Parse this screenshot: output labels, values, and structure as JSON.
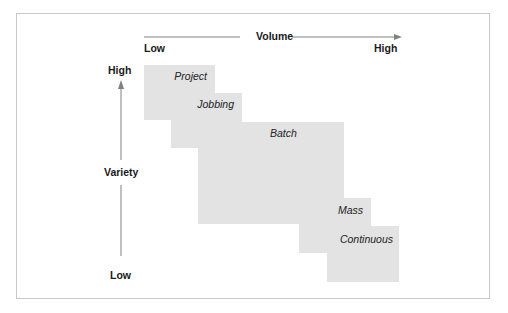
{
  "diagram": {
    "axes": {
      "x": {
        "title": "Volume",
        "low": "Low",
        "high": "High"
      },
      "y": {
        "title": "Variety",
        "low": "Low",
        "high": "High"
      }
    },
    "processes": [
      {
        "label": "Project"
      },
      {
        "label": "Jobbing"
      },
      {
        "label": "Batch"
      },
      {
        "label": "Mass"
      },
      {
        "label": "Continuous"
      }
    ],
    "colors": {
      "box_fill": "#e3e3e3",
      "arrow": "#808080",
      "frame": "#c8c8c8"
    }
  }
}
